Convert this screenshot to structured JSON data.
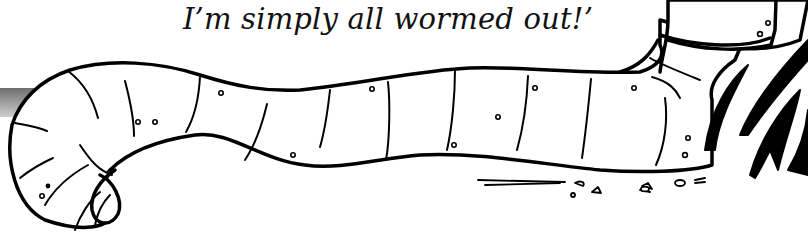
{
  "caption": {
    "text": "I’m simply all wormed out!’"
  },
  "illustration": {
    "subject": "cartoon worm lying on ground beside grass",
    "stroke_color": "#000000",
    "fill_color": "#ffffff",
    "shadow_color": "#9a9a9a"
  }
}
